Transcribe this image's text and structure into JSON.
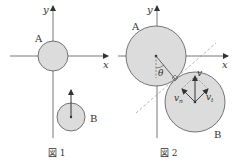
{
  "figures": [
    {
      "caption": "図 1",
      "axis_x_label": "x",
      "axis_y_label": "y",
      "ball_a_label": "A",
      "ball_b_label": "B"
    },
    {
      "caption": "図 2",
      "axis_x_label": "x",
      "axis_y_label": "y",
      "ball_a_label": "A",
      "ball_b_label": "B",
      "angle_label": "θ",
      "velocity_label": "v",
      "normal_component_label": "v",
      "normal_component_sub": "n",
      "tangential_component_label": "v",
      "tangential_component_sub": "t"
    }
  ],
  "colors": {
    "ball_fill": "#dcdcdc",
    "line": "#444444",
    "dashed": "#9a9a9a"
  }
}
